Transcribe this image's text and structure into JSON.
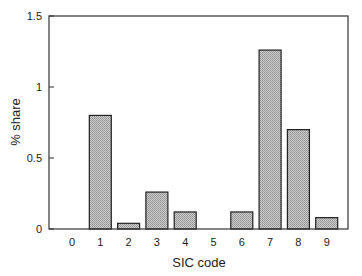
{
  "chart_data": {
    "type": "bar",
    "title": "",
    "xlabel": "SIC code",
    "ylabel": "% share",
    "categories": [
      "0",
      "1",
      "2",
      "3",
      "4",
      "5",
      "6",
      "7",
      "8",
      "9"
    ],
    "values": [
      0,
      0.8,
      0.04,
      0.26,
      0.12,
      0,
      0.12,
      1.26,
      0.7,
      0.08
    ],
    "ylim": [
      0,
      1.5
    ],
    "yticks": [
      "0",
      "0.5",
      "1",
      "1.5"
    ],
    "grid": false,
    "bar_fill": "#b8b8b8",
    "bar_edge": "#222222"
  }
}
